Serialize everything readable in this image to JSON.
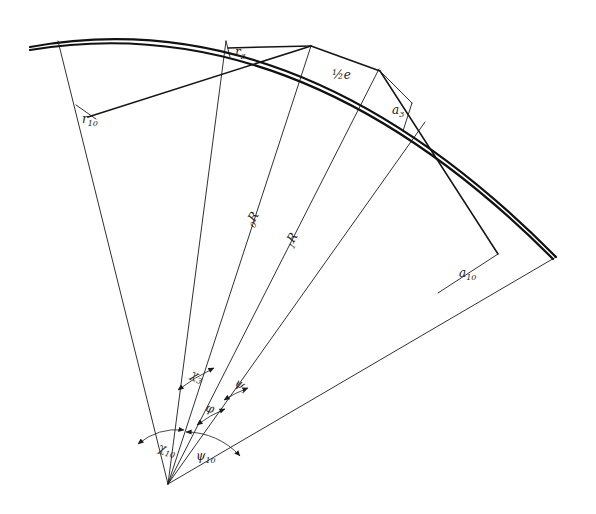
{
  "figure": {
    "background_color": "#ffffff",
    "line_color": "#1a1a1a",
    "apex": {
      "x": 168,
      "y": 484
    },
    "labels": {
      "r10": {
        "base": "r",
        "sub": "10",
        "x": 82,
        "y": 123
      },
      "r3": {
        "base": "r",
        "sub": "3",
        "x": 235,
        "y": 56
      },
      "half_e": {
        "base": "½e",
        "sub": "",
        "x": 332,
        "y": 79
      },
      "a3": {
        "base": "a",
        "sub": "3",
        "x": 392,
        "y": 114
      },
      "a10": {
        "base": "a",
        "sub": "10",
        "x": 459,
        "y": 277
      },
      "R0": {
        "base": "R",
        "sub": "0",
        "x": 252,
        "y": 227
      },
      "R1": {
        "base": "R",
        "sub": "1",
        "x": 291,
        "y": 248
      },
      "chi3": {
        "base": "χ",
        "sub": "3",
        "x": 190,
        "y": 377
      },
      "phi": {
        "base": "φ",
        "sub": "",
        "x": 205,
        "y": 411
      },
      "psi1": {
        "base": "ψ",
        "sub": "1",
        "x": 234,
        "y": 385
      },
      "chi10": {
        "base": "χ",
        "sub": "10",
        "x": 158,
        "y": 451
      },
      "psi10": {
        "base": "ψ",
        "sub": "10",
        "x": 196,
        "y": 460
      }
    },
    "elements": {
      "outer_arc": "thick circular arc spanning upper left to right side",
      "inner_arc": "thick circular arc just inside the outer arc",
      "radial_rays": "seven straight lines converging at the apex",
      "chord_r10": "short chord labelled r10",
      "chord_r3": "short chord labelled r3",
      "chord_a3": "short chord labelled a3",
      "chord_a10": "long chord labelled a10",
      "angle_arc_chi3": "double-headed arc between rays labelled chi3",
      "angle_arc_phi": "double-headed arc between rays labelled phi",
      "angle_arc_psi1": "double-headed arc between rays labelled psi1",
      "angle_arc_chi10": "double-headed arc between rays labelled chi10",
      "angle_arc_psi10": "double-headed arc between rays labelled psi10"
    }
  }
}
